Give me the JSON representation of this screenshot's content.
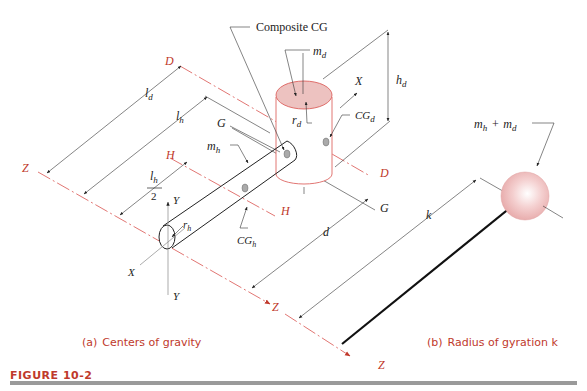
{
  "figure": {
    "label": "FIGURE 10-2",
    "accent_color": "#c0392b",
    "panel_a": {
      "caption_prefix": "(a)",
      "caption": "Centers of gravity",
      "labels": {
        "composite_cg": "Composite CG",
        "m_d": "m",
        "m_d_sub": "d",
        "r_d": "r",
        "r_d_sub": "d",
        "h_d": "h",
        "h_d_sub": "d",
        "cg_d": "CG",
        "cg_d_sub": "d",
        "l_d": "l",
        "l_d_sub": "d",
        "l_h": "l",
        "l_h_sub": "h",
        "l_h_half_num": "l",
        "l_h_half_sub": "h",
        "l_h_half_den": "2",
        "m_h": "m",
        "m_h_sub": "h",
        "r_h": "r",
        "r_h_sub": "h",
        "cg_h": "CG",
        "cg_h_sub": "h",
        "d": "d",
        "axis_D_top": "D",
        "axis_D_right": "D",
        "axis_H_left": "H",
        "axis_H_bottom": "H",
        "axis_G_left": "G",
        "axis_G_right": "G",
        "axis_Z_left": "Z",
        "axis_Z_bottom": "Z",
        "axis_X_left": "X",
        "axis_X_top": "X",
        "axis_Y_top": "Y",
        "axis_Y_bottom": "Y"
      }
    },
    "panel_b": {
      "caption_prefix": "(b)",
      "caption": "Radius of gyration k",
      "labels": {
        "mass_sum_a": "m",
        "mass_sum_a_sub": "h",
        "plus": "+",
        "mass_sum_b": "m",
        "mass_sum_b_sub": "d",
        "k": "k",
        "axis_Z": "Z"
      }
    }
  }
}
